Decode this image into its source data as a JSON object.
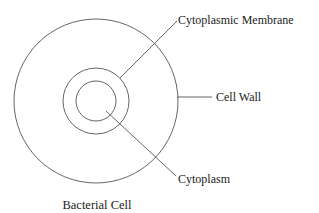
{
  "diagram": {
    "title": "Bacterial Cell",
    "labels": {
      "membrane": "Cytoplasmic Membrane",
      "wall": "Cell Wall",
      "cytoplasm": "Cytoplasm"
    },
    "structure": [
      {
        "name": "Cell Wall",
        "shape": "circle",
        "role": "outer"
      },
      {
        "name": "Cytoplasmic Membrane",
        "shape": "circle",
        "role": "middle"
      },
      {
        "name": "Cytoplasm",
        "shape": "circle",
        "role": "inner"
      }
    ],
    "line_color": "#555555",
    "text_color": "#222222"
  }
}
